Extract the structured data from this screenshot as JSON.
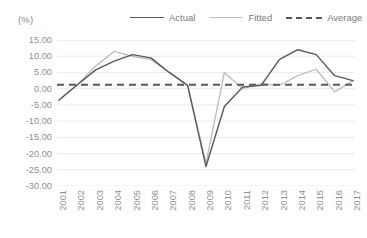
{
  "axis_unit_label": "(%)",
  "legend": {
    "position": "top",
    "items": [
      {
        "label": "Actual",
        "style": "solid",
        "color": "#595959"
      },
      {
        "label": "Fitted",
        "style": "solid",
        "color": "#bfbfbf"
      },
      {
        "label": "Average",
        "style": "dashed",
        "color": "#595959"
      }
    ]
  },
  "chart_data": {
    "type": "line",
    "title": "",
    "xlabel": "",
    "ylabel": "(%)",
    "ylim": [
      -30,
      15
    ],
    "ytick_labels": [
      "15.00",
      "10.00",
      "5.00",
      "0.00",
      "-5.00",
      "-10.00",
      "-15.00",
      "-20.00",
      "-25.00",
      "-30.00"
    ],
    "ytick_values": [
      15,
      10,
      5,
      0,
      -5,
      -10,
      -15,
      -20,
      -25,
      -30
    ],
    "grid": true,
    "grid_axis": "y",
    "categories": [
      "2001",
      "2002",
      "2003",
      "2004",
      "2005",
      "2006",
      "2007",
      "2008",
      "2009",
      "2010",
      "2011",
      "2012",
      "2013",
      "2014",
      "2015",
      "2016",
      "2017"
    ],
    "series": [
      {
        "name": "Actual",
        "color": "#595959",
        "style": "solid",
        "values": [
          -3.5,
          1.2,
          5.8,
          8.5,
          10.5,
          9.5,
          5.0,
          1.0,
          -24.0,
          -5.5,
          0.5,
          1.0,
          9.0,
          12.0,
          10.5,
          4.0,
          2.5
        ]
      },
      {
        "name": "Fitted",
        "color": "#bfbfbf",
        "style": "solid",
        "values": [
          -3.5,
          1.2,
          7.0,
          11.5,
          10.0,
          9.0,
          5.0,
          1.0,
          -23.0,
          5.0,
          0.0,
          1.5,
          1.0,
          4.0,
          6.0,
          -1.0,
          2.5
        ]
      },
      {
        "name": "Average",
        "color": "#595959",
        "style": "dashed",
        "constant": 1.2
      }
    ]
  }
}
